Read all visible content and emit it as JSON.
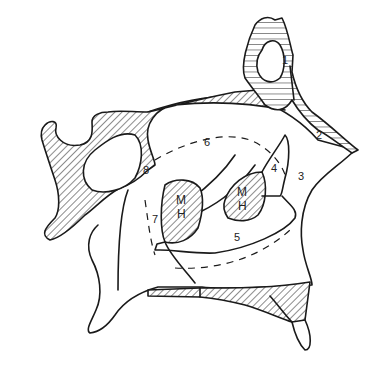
{
  "figure": {
    "type": "anatomical line drawing",
    "stroke_color": "#1a1a1a",
    "background": "#ffffff",
    "labels": {
      "l1": "1",
      "l2": "2",
      "l3": "3",
      "l4": "4",
      "l5": "5",
      "l6": "6",
      "l7": "7",
      "l8": "8",
      "mh_left_m": "M",
      "mh_left_h": "H",
      "mh_right_m": "M",
      "mh_right_h": "H"
    }
  }
}
